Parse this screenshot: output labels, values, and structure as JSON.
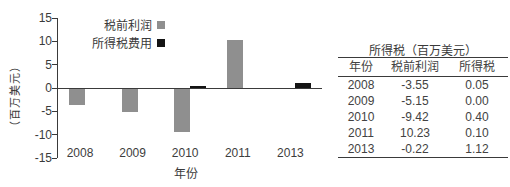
{
  "chart_data": {
    "type": "bar",
    "categories": [
      "2008",
      "2009",
      "2010",
      "2011",
      "2013"
    ],
    "series": [
      {
        "name": "税前利润",
        "color": "#8f8f8f",
        "values": [
          -3.55,
          -5.15,
          -9.42,
          10.23,
          -0.22
        ]
      },
      {
        "name": "所得税费用",
        "color": "#141414",
        "values": [
          0.05,
          0.0,
          0.4,
          0.1,
          1.12
        ]
      }
    ],
    "xlabel": "年份",
    "ylabel": "（百万美元）",
    "ylim": [
      -15,
      15
    ],
    "yticks": [
      "15",
      "10",
      "5",
      "0",
      "-5",
      "-10",
      "-15"
    ],
    "grid": false,
    "legend_position": "top-inside"
  },
  "table": {
    "title": "所得税（百万美元）",
    "headers": [
      "年份",
      "税前利润",
      "所得税"
    ],
    "rows": [
      [
        "2008",
        "-3.55",
        "0.05"
      ],
      [
        "2009",
        "-5.15",
        "0.00"
      ],
      [
        "2010",
        "-9.42",
        "0.40"
      ],
      [
        "2011",
        "10.23",
        "0.10"
      ],
      [
        "2013",
        "-0.22",
        "1.12"
      ]
    ]
  },
  "colors": {
    "bar_gray": "#8f8f8f",
    "bar_black": "#141414",
    "axis": "#3a3a3a",
    "text": "#3a3a3a",
    "background": "#ffffff"
  }
}
